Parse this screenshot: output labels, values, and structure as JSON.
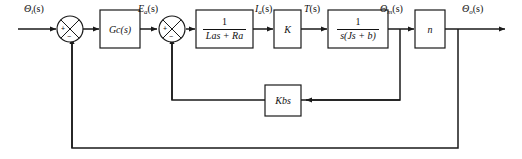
{
  "diagram": {
    "line_color": "#1a1a1a",
    "block_fill": "#ffffff",
    "signals": {
      "input": "Θi(s)",
      "input_main": "Θ",
      "input_sub": "i",
      "input_tail": "(s)",
      "error_voltage_main": "E",
      "error_voltage_sub": "a",
      "error_voltage_tail": "(s)",
      "armature_current_main": "I",
      "armature_current_sub": "a",
      "armature_current_tail": "(s)",
      "torque_main": "T",
      "torque_tail": "(s)",
      "motor_angle_main": "Θ",
      "motor_angle_sub": "m",
      "motor_angle_tail": "(s)",
      "output_main": "Θ",
      "output_sub": "o",
      "output_tail": "(s)"
    },
    "blocks": {
      "controller": "Gc(s)",
      "controller_main": "G",
      "controller_sub": "c",
      "controller_tail": "(s)",
      "armature": {
        "numerator": "1",
        "denominator_main": "L",
        "denominator_sub": "a",
        "denominator_tail": "s + R",
        "denominator_sub2": "a"
      },
      "torque_constant": "K",
      "mechanical": {
        "numerator": "1",
        "denominator": "s(Js + b)"
      },
      "gear_ratio": "n",
      "back_emf_main": "K",
      "back_emf_sub": "b",
      "back_emf_tail": "s"
    },
    "summing_junctions": [
      {
        "name": "outer-summing-junction",
        "plus": "+",
        "minus": "−"
      },
      {
        "name": "inner-summing-junction",
        "plus": "+",
        "minus": "−"
      }
    ]
  }
}
